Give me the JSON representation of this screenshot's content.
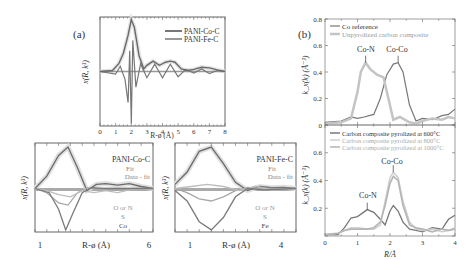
{
  "panel_labels": {
    "a": "(a)",
    "b": "(b)"
  },
  "colors": {
    "dark": "#555555",
    "mid": "#8a8a8a",
    "light": "#bdbdbd",
    "fill": "#d8d8d8",
    "frame": "#666666"
  },
  "chart_data": [
    {
      "id": "a-main",
      "type": "line",
      "title": "",
      "xlabel": "R-ø (Å)",
      "ylabel": "x(R, k³)",
      "xlim": [
        0,
        8
      ],
      "xticks": [
        "0",
        "1",
        "2",
        "3",
        "4",
        "5",
        "6",
        "7",
        "8"
      ],
      "legend": [
        "PANI-Co-C",
        "PANI-Fe-C"
      ],
      "series": [
        {
          "name": "PANI-Co-C magnitude",
          "x": [
            0,
            0.8,
            1.2,
            1.5,
            1.8,
            2.0,
            2.2,
            2.5,
            2.8,
            3.0,
            3.4,
            3.8,
            4.2,
            4.5,
            4.8,
            5.2,
            5.6,
            6.0,
            6.5,
            7.0,
            7.5,
            8.0
          ],
          "y": [
            0,
            0.02,
            0.15,
            0.35,
            0.7,
            1.0,
            0.85,
            0.3,
            0.05,
            0.12,
            0.2,
            0.12,
            0.18,
            0.2,
            0.18,
            0.05,
            0.02,
            0.04,
            0.08,
            0.07,
            0.03,
            0
          ]
        },
        {
          "name": "PANI-Fe-C imaginary",
          "x": [
            0,
            1.0,
            1.3,
            1.6,
            1.8,
            1.9,
            2.0,
            2.1,
            2.3,
            2.6,
            3.0,
            3.5,
            4.0,
            4.5,
            5.0,
            5.5,
            6.0,
            6.5,
            7.0,
            7.5,
            8.0
          ],
          "y": [
            0,
            -0.05,
            0.1,
            -0.15,
            -0.6,
            0.4,
            -1.0,
            0.6,
            -0.3,
            0.15,
            -0.12,
            0.14,
            -0.12,
            0.14,
            -0.1,
            0.04,
            -0.03,
            0.05,
            -0.04,
            0.02,
            0
          ]
        }
      ]
    },
    {
      "id": "a-co",
      "type": "line",
      "xlabel": "R-ø (Å)",
      "ylabel": "x(R, k³)",
      "xlim": [
        1,
        6
      ],
      "xticks": [
        "1",
        "6"
      ],
      "annotations": {
        "title": "PANI-Co-C",
        "fit": "Fit",
        "diff": "Data - fit",
        "shells": [
          "O or N",
          "S",
          "Co"
        ]
      },
      "series": [
        {
          "name": "Fit",
          "x": [
            1,
            1.5,
            2.0,
            2.4,
            2.8,
            3.2,
            3.6,
            4.0,
            4.5,
            5.0,
            5.5,
            6.0
          ],
          "y": [
            0,
            0.3,
            0.8,
            1.0,
            0.5,
            -0.05,
            0.1,
            0.12,
            0.08,
            0.12,
            0.05,
            0
          ]
        },
        {
          "name": "O or N",
          "x": [
            1,
            1.5,
            2.0,
            2.4,
            2.8,
            3.2,
            3.6,
            4.0,
            5.0,
            6.0
          ],
          "y": [
            0,
            -0.1,
            -0.35,
            -0.4,
            -0.1,
            0.02,
            -0.02,
            0,
            0,
            0
          ]
        },
        {
          "name": "S",
          "x": [
            1,
            1.5,
            2.0,
            2.5,
            3.0,
            3.5,
            4.0,
            4.5,
            5.0,
            6.0
          ],
          "y": [
            0,
            -0.05,
            -0.15,
            -0.2,
            -0.05,
            -0.1,
            -0.05,
            -0.1,
            -0.03,
            0
          ]
        },
        {
          "name": "Co",
          "x": [
            1,
            1.6,
            2.0,
            2.3,
            2.6,
            3.0,
            3.4,
            4.0,
            5.0,
            6.0
          ],
          "y": [
            0,
            -0.1,
            -0.5,
            -1.0,
            -0.6,
            -0.1,
            0.02,
            0,
            0,
            0
          ]
        }
      ]
    },
    {
      "id": "a-fe",
      "type": "line",
      "xlabel": "R-ø (Å)",
      "ylabel": "x(R, k³)",
      "xlim": [
        1,
        4
      ],
      "xticks": [
        "1",
        "4"
      ],
      "annotations": {
        "title": "PANI-Fe-C",
        "fit": "Fit",
        "diff": "Data - fit",
        "shells": [
          "O or N",
          "S",
          "Fe"
        ]
      },
      "series": [
        {
          "name": "Fit",
          "x": [
            1,
            1.3,
            1.6,
            1.9,
            2.2,
            2.5,
            2.8,
            3.1,
            3.4,
            3.7,
            4.0
          ],
          "y": [
            0.1,
            0.4,
            0.9,
            1.0,
            0.6,
            0.15,
            -0.05,
            0.05,
            0.02,
            0.03,
            0
          ]
        },
        {
          "name": "O or N",
          "x": [
            1,
            1.3,
            1.6,
            1.9,
            2.2,
            2.5,
            2.8,
            3.2,
            4.0
          ],
          "y": [
            0,
            -0.1,
            -0.25,
            -0.3,
            -0.2,
            -0.05,
            0.03,
            0,
            0
          ]
        },
        {
          "name": "S",
          "x": [
            1,
            1.4,
            1.8,
            2.2,
            2.6,
            3.0,
            3.4,
            4.0
          ],
          "y": [
            0,
            0.05,
            0.1,
            0.05,
            -0.05,
            0.06,
            -0.03,
            0
          ]
        },
        {
          "name": "Fe",
          "x": [
            1,
            1.3,
            1.6,
            1.9,
            2.2,
            2.5,
            2.8,
            3.2,
            4.0
          ],
          "y": [
            -0.05,
            -0.3,
            -0.8,
            -1.0,
            -0.7,
            -0.2,
            0.0,
            -0.03,
            0
          ]
        }
      ]
    },
    {
      "id": "b-top",
      "type": "line",
      "xlabel": "",
      "ylabel": "k_x(k) (Å⁻³)",
      "xlim": [
        0,
        4
      ],
      "ylim": [
        0,
        0.8
      ],
      "yticks": [
        "0",
        "0.2",
        "0.4",
        "0.6",
        "0.8"
      ],
      "legend": [
        "Co reference",
        "Unpyrolized carbon composite"
      ],
      "annotations": [
        {
          "text": "Co-N",
          "x": 1.25,
          "y": 0.47
        },
        {
          "text": "Co-Co",
          "x": 2.25,
          "y": 0.47
        }
      ],
      "series": [
        {
          "name": "Co reference",
          "x": [
            0,
            0.5,
            0.8,
            1.0,
            1.2,
            1.5,
            1.7,
            1.9,
            2.1,
            2.25,
            2.4,
            2.6,
            2.8,
            3.0,
            3.3,
            3.6,
            3.8,
            4.0
          ],
          "y": [
            0.02,
            0.03,
            0.06,
            0.05,
            0.06,
            0.08,
            0.2,
            0.38,
            0.46,
            0.47,
            0.4,
            0.15,
            0.03,
            0.05,
            0.04,
            0.07,
            0.08,
            0.12
          ]
        },
        {
          "name": "Unpyrolized carbon composite",
          "x": [
            0,
            0.5,
            0.8,
            1.0,
            1.1,
            1.25,
            1.4,
            1.6,
            1.8,
            1.95,
            2.1,
            2.3,
            2.6,
            2.8,
            3.0,
            3.3,
            3.6,
            3.8,
            4.0
          ],
          "y": [
            0.01,
            0.02,
            0.05,
            0.25,
            0.4,
            0.47,
            0.42,
            0.38,
            0.36,
            0.2,
            0.04,
            0.06,
            0.02,
            0.01,
            0.03,
            0.05,
            0.04,
            0.06,
            0.05
          ]
        }
      ]
    },
    {
      "id": "b-bottom",
      "type": "line",
      "xlabel": "R/Å",
      "ylabel": "k_x(k) (Å⁻³)",
      "xlim": [
        0,
        4
      ],
      "ylim": [
        0,
        0.8
      ],
      "xticks": [
        "0",
        "1",
        "2",
        "3",
        "4"
      ],
      "yticks": [
        "0.2",
        "0.4",
        "0.6"
      ],
      "legend": [
        "Carbon composite pyrolized at 600°C",
        "Carbon composite pyrolized at 800°C",
        "Carbon composite pyrolized at 1000°C"
      ],
      "annotations": [
        {
          "text": "Co-N",
          "x": 1.3,
          "y": 0.19
        },
        {
          "text": "Co-Co",
          "x": 2.1,
          "y": 0.46
        }
      ],
      "series": [
        {
          "name": "600°C",
          "x": [
            0,
            0.4,
            0.6,
            0.8,
            1.0,
            1.3,
            1.5,
            1.7,
            1.85,
            2.0,
            2.1,
            2.25,
            2.4,
            2.6,
            2.8,
            3.0,
            3.3,
            3.6,
            3.8,
            4.0
          ],
          "y": [
            0.01,
            0.01,
            0.06,
            0.13,
            0.14,
            0.19,
            0.17,
            0.12,
            0.08,
            0.18,
            0.22,
            0.18,
            0.1,
            0.05,
            0.04,
            0.03,
            0.06,
            0.05,
            0.12,
            0.15
          ]
        },
        {
          "name": "800°C",
          "x": [
            0,
            0.4,
            0.6,
            0.8,
            1.0,
            1.3,
            1.5,
            1.7,
            1.85,
            2.0,
            2.1,
            2.25,
            2.4,
            2.6,
            2.8,
            3.0,
            3.3,
            3.6,
            3.8,
            4.0
          ],
          "y": [
            0.01,
            0.02,
            0.04,
            0.06,
            0.06,
            0.05,
            0.05,
            0.08,
            0.25,
            0.42,
            0.46,
            0.42,
            0.25,
            0.1,
            0.05,
            0.04,
            0.05,
            0.03,
            0.04,
            0.06
          ]
        },
        {
          "name": "1000°C",
          "x": [
            0,
            0.4,
            0.6,
            0.8,
            1.0,
            1.3,
            1.5,
            1.7,
            1.85,
            2.0,
            2.1,
            2.25,
            2.4,
            2.6,
            2.8,
            3.0,
            3.3,
            3.6,
            3.8,
            4.0
          ],
          "y": [
            0.01,
            0.02,
            0.04,
            0.05,
            0.05,
            0.05,
            0.06,
            0.1,
            0.22,
            0.38,
            0.43,
            0.4,
            0.22,
            0.08,
            0.06,
            0.05,
            0.03,
            0.05,
            0.04,
            0.05
          ]
        }
      ]
    }
  ]
}
